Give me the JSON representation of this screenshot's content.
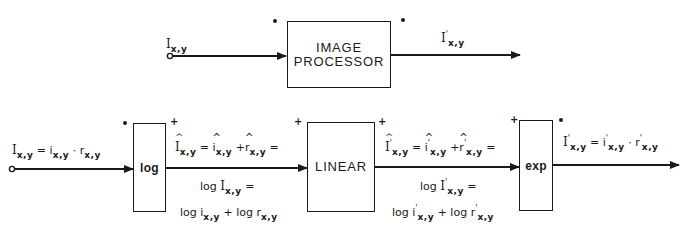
{
  "top_chain": {
    "input_label": {
      "base": "I",
      "sub": "x,y"
    },
    "processor_box": {
      "line1": "IMAGE",
      "line2": "PROCESSOR"
    },
    "output_label": {
      "base": "I",
      "prime": "'",
      "sub": "x,y"
    }
  },
  "bottom_chain": {
    "input_equation": {
      "lhs": "I",
      "lhs_sub": "x,y",
      "eq": "=",
      "t1": "i",
      "t1_sub": "x,y",
      "op": "·",
      "t2": "r",
      "t2_sub": "x,y"
    },
    "log_box": {
      "label": "log"
    },
    "linear_box": {
      "label": "LINEAR"
    },
    "exp_box": {
      "label": "exp"
    },
    "log_output_top": {
      "lhs": "I",
      "lhs_sub": "x,y",
      "eq": "=",
      "t1": "i",
      "t1_sub": "x,y",
      "op": "+",
      "t2": "r",
      "t2_sub": "x,y",
      "trail": "="
    },
    "log_output_mid": {
      "fn": "log",
      "arg": "I",
      "arg_sub": "x,y",
      "eq": "="
    },
    "log_output_bottom": {
      "fn1": "log",
      "t1": "i",
      "t1_sub": "x,y",
      "op": "+",
      "fn2": "log",
      "t2": "r",
      "t2_sub": "x,y"
    },
    "linear_output_top": {
      "lhs": "I",
      "lhs_prime": "'",
      "lhs_sub": "x,y",
      "eq": "=",
      "t1": "i",
      "t1_prime": "'",
      "t1_sub": "x,y",
      "op": "+",
      "t2": "r",
      "t2_prime": "'",
      "t2_sub": "x,y",
      "trail": "="
    },
    "linear_output_mid": {
      "fn": "log",
      "arg": "I",
      "arg_prime": "'",
      "arg_sub": "x,y",
      "eq": "="
    },
    "linear_output_bottom": {
      "fn1": "log",
      "t1": "i",
      "t1_prime": "'",
      "t1_sub": "x,y",
      "op": "+",
      "fn2": "log",
      "t2": "r",
      "t2_prime": "'",
      "t2_sub": "x,y"
    },
    "output_equation": {
      "lhs": "I",
      "lhs_prime": "'",
      "lhs_sub": "x,y",
      "eq": "=",
      "t1": "i",
      "t1_prime": "'",
      "t1_sub": "x,y",
      "op": "·",
      "t2": "r",
      "t2_prime": "'",
      "t2_sub": "x,y"
    }
  },
  "markers": {
    "multiplicative": "•",
    "additive": "+"
  },
  "colors": {
    "ink": "#1a1a1a",
    "paper": "#ffffff"
  }
}
